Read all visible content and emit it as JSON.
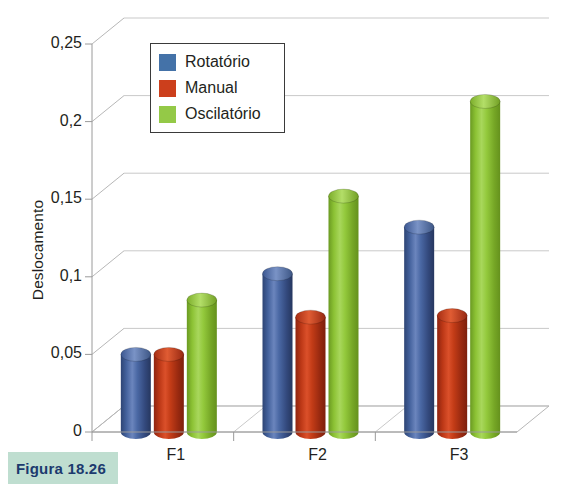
{
  "caption": {
    "text": "Figura 18.26",
    "background_color": "#bfded0",
    "text_color": "#1c3a6e"
  },
  "legend": {
    "position": "top-center-left",
    "entries": [
      {
        "label": "Rotatório",
        "color": "#4472a8"
      },
      {
        "label": "Manual",
        "color": "#cc3f1c"
      },
      {
        "label": "Oscilatório",
        "color": "#94c947"
      }
    ]
  },
  "axes": {
    "y_title": "Deslocamento",
    "y_ticks": [
      "0",
      "0,05",
      "0,1",
      "0,15",
      "0,2",
      "0,25"
    ],
    "x_ticks": [
      "F1",
      "F2",
      "F3"
    ]
  },
  "chart_data": {
    "type": "bar",
    "title": "",
    "subtitle": "",
    "xlabel": "",
    "ylabel": "Deslocamento",
    "categories": [
      "F1",
      "F2",
      "F3"
    ],
    "series": [
      {
        "name": "Rotatório",
        "color": "#4472a8",
        "values": [
          0.05,
          0.102,
          0.132
        ]
      },
      {
        "name": "Manual",
        "color": "#cc3f1c",
        "values": [
          0.05,
          0.074,
          0.075
        ]
      },
      {
        "name": "Oscilatório",
        "color": "#94c947",
        "values": [
          0.085,
          0.152,
          0.213
        ]
      }
    ],
    "ylim": [
      0,
      0.25
    ],
    "ytick_values": [
      0,
      0.05,
      0.1,
      0.15,
      0.2,
      0.25
    ],
    "grid": true,
    "three_d": true,
    "legend_position": "inside-top-left"
  }
}
